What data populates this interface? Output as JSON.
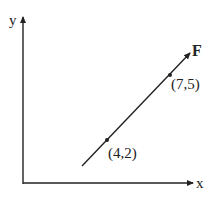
{
  "axes": {
    "x_label": "x",
    "y_label": "y"
  },
  "vector": {
    "label": "F"
  },
  "points": [
    {
      "label": "(4,2)",
      "x": 4,
      "y": 2
    },
    {
      "label": "(7,5)",
      "x": 7,
      "y": 5
    }
  ],
  "colors": {
    "line": "#222222",
    "background": "#ffffff"
  }
}
